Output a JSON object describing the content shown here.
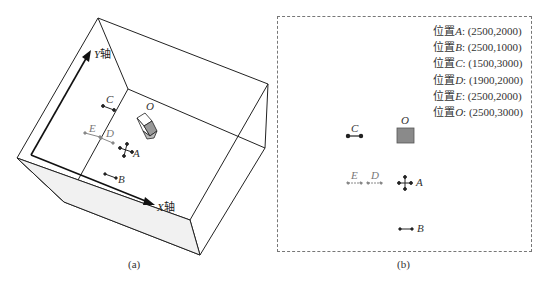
{
  "panel_a": {
    "caption": "(a)",
    "x_axis_label": "X",
    "x_axis_suffix": "轴",
    "y_axis_label": "Y",
    "y_axis_suffix": "轴",
    "point_labels": {
      "O": "O",
      "A": "A",
      "B": "B",
      "C": "C",
      "D": "D",
      "E": "E"
    }
  },
  "panel_b": {
    "caption": "(b)",
    "legend": [
      {
        "prefix": "位置",
        "name": "A",
        "coords": ": (2500,2000)"
      },
      {
        "prefix": "位置",
        "name": "B",
        "coords": ": (2500,1000)"
      },
      {
        "prefix": "位置",
        "name": "C",
        "coords": ": (1500,3000)"
      },
      {
        "prefix": "位置",
        "name": "D",
        "coords": ": (1900,2000)"
      },
      {
        "prefix": "位置",
        "name": "E",
        "coords": ": (2500,2000)"
      },
      {
        "prefix": "位置",
        "name": "O",
        "coords": ": (2500,3000)"
      }
    ],
    "point_labels": {
      "O": "O",
      "A": "A",
      "B": "B",
      "C": "C",
      "D": "D",
      "E": "E"
    },
    "colors": {
      "O_fill": "#8a8a8a",
      "marker_dark": "#222222",
      "marker_light": "#888888"
    }
  }
}
